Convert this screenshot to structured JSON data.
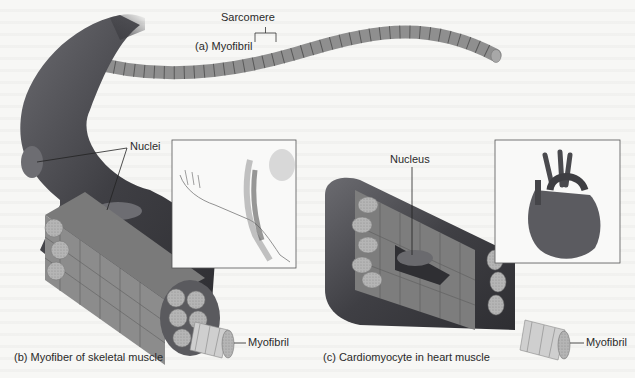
{
  "figure": {
    "panel_a": {
      "caption": "(a) Myofibril",
      "label_sarcomere": "Sarcomere"
    },
    "panel_b": {
      "caption": "(b) Myofiber of skeletal muscle",
      "label_nuclei": "Nuclei",
      "label_myofibril": "Myofibril",
      "inset": "arm-muscle-illustration"
    },
    "panel_c": {
      "caption": "(c) Cardiomyocyte in heart muscle",
      "label_nucleus": "Nucleus",
      "label_myofibril": "Myofibril",
      "inset": "heart-illustration"
    }
  },
  "colors": {
    "fiber_dark": "#4a4a4e",
    "fibril_gray": "#9a9a9a",
    "background": "#f7f7f5",
    "line": "#333333"
  }
}
